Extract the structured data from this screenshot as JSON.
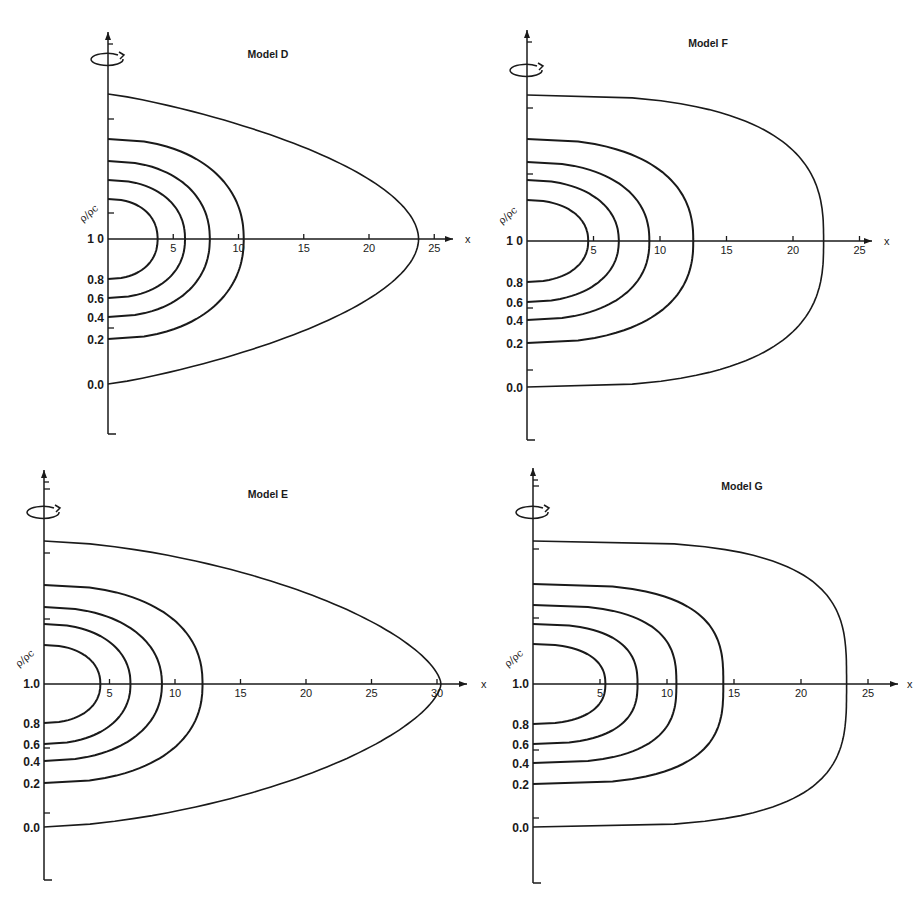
{
  "chart_data": [
    {
      "type": "line",
      "title": "Model D",
      "xlabel": "x",
      "ylabel": "ρ/ρc",
      "x_ticks": [
        5,
        10,
        15,
        20,
        25
      ],
      "contour_labels": [
        "1.0",
        "0.8",
        "0.6",
        "0.4",
        "0.2",
        "0.0"
      ],
      "contour_levels": [
        {
          "level": "0.8",
          "x_extent": 3.8
        },
        {
          "level": "0.6",
          "x_extent": 5.9
        },
        {
          "level": "0.4",
          "x_extent": 7.8
        },
        {
          "level": "0.2",
          "x_extent": 10.4
        },
        {
          "level": "0.0",
          "x_extent": 23.8
        }
      ],
      "xlim": [
        0,
        26
      ],
      "grid": false,
      "note": "Isodensity contours of rotating model; outer surface pointed (cusp) at x≈24"
    },
    {
      "type": "line",
      "title": "Model F",
      "xlabel": "x",
      "ylabel": "ρ/ρc",
      "x_ticks": [
        5,
        10,
        15,
        20,
        25
      ],
      "contour_labels": [
        "1.0",
        "0.8",
        "0.6",
        "0.4",
        "0.2",
        "0.0"
      ],
      "contour_levels": [
        {
          "level": "0.8",
          "x_extent": 4.6
        },
        {
          "level": "0.6",
          "x_extent": 6.9
        },
        {
          "level": "0.4",
          "x_extent": 9.2
        },
        {
          "level": "0.2",
          "x_extent": 12.5
        },
        {
          "level": "0.0",
          "x_extent": 22.3
        }
      ],
      "xlim": [
        0,
        26
      ],
      "grid": false
    },
    {
      "type": "line",
      "title": "Model E",
      "xlabel": "x",
      "ylabel": "ρ/ρc",
      "x_ticks": [
        5,
        10,
        15,
        20,
        25,
        30
      ],
      "contour_labels": [
        "1.0",
        "0.8",
        "0.6",
        "0.4",
        "0.2",
        "0.0"
      ],
      "contour_levels": [
        {
          "level": "0.8",
          "x_extent": 4.3
        },
        {
          "level": "0.6",
          "x_extent": 6.6
        },
        {
          "level": "0.4",
          "x_extent": 9.0
        },
        {
          "level": "0.2",
          "x_extent": 12.1
        },
        {
          "level": "0.0",
          "x_extent": 30.3
        }
      ],
      "xlim": [
        0,
        32
      ],
      "grid": false
    },
    {
      "type": "line",
      "title": "Model G",
      "xlabel": "x",
      "ylabel": "ρ/ρc",
      "x_ticks": [
        5,
        10,
        15,
        20,
        25
      ],
      "contour_labels": [
        "1.0",
        "0.8",
        "0.6",
        "0.4",
        "0.2",
        "0.0"
      ],
      "contour_levels": [
        {
          "level": "0.8",
          "x_extent": 5.4
        },
        {
          "level": "0.6",
          "x_extent": 7.8
        },
        {
          "level": "0.4",
          "x_extent": 10.7
        },
        {
          "level": "0.2",
          "x_extent": 14.2
        },
        {
          "level": "0.0",
          "x_extent": 23.4
        }
      ],
      "xlim": [
        0,
        26
      ],
      "grid": false
    }
  ],
  "panels": [
    {
      "title": "Model D",
      "layout": {
        "ox": 108,
        "oy": 239,
        "sx": 13.05,
        "axis_top": 32,
        "axis_bot": 434,
        "arrow_end": 453,
        "title_x": 268,
        "title_y": 58,
        "rot_y": 58,
        "x_lbl_x": 465,
        "offsets": [
          40,
          59,
          78,
          100,
          145
        ],
        "shapes": [
          2.2,
          2.2,
          2.2,
          2.2,
          1.25
        ],
        "outer_cusp": true,
        "extra_ticks": [
          -120,
          -26,
          89
        ]
      },
      "x_axis_label": "x",
      "y_axis_label": "ρ/ρc",
      "y_labels": [
        "1 0",
        "0.8",
        "0.6",
        "0.4",
        "0.2",
        "0.0"
      ],
      "x_tick_labels": [
        "5",
        "10",
        "15",
        "20",
        "25"
      ]
    },
    {
      "title": "Model F",
      "layout": {
        "ox": 527,
        "oy": 241,
        "sx": 13.3,
        "axis_top": 30,
        "axis_bot": 440,
        "arrow_end": 872,
        "title_x": 708,
        "title_y": 47,
        "rot_y": 69,
        "x_lbl_x": 884,
        "offsets": [
          41,
          61,
          79,
          102,
          146
        ],
        "shapes": [
          2.2,
          2.2,
          2.3,
          2.4,
          2.8
        ],
        "outer_cusp": false,
        "extra_ticks": [
          -133,
          -67,
          67,
          129
        ]
      },
      "x_axis_label": "x",
      "y_axis_label": "ρ/ρc",
      "y_labels": [
        "1 0",
        "0.8",
        "0.6",
        "0.4",
        "0.2",
        "0.0"
      ],
      "x_tick_labels": [
        "5",
        "10",
        "15",
        "20",
        "25"
      ]
    },
    {
      "title": "Model E",
      "layout": {
        "ox": 44,
        "oy": 684,
        "sx": 13.1,
        "axis_top": 470,
        "axis_bot": 880,
        "arrow_end": 467,
        "title_x": 268,
        "title_y": 498,
        "rot_y": 511,
        "x_lbl_x": 481,
        "offsets": [
          39,
          60,
          77,
          99,
          143
        ],
        "shapes": [
          2.2,
          2.2,
          2.2,
          2.3,
          1.6
        ],
        "outer_cusp": false,
        "extra_ticks": [
          -195,
          -131,
          -65,
          64,
          129
        ]
      },
      "x_axis_label": "x",
      "y_axis_label": "ρ/ρc",
      "y_labels": [
        "1.0",
        "0.8",
        "0.6",
        "0.4",
        "0.2",
        "0.0"
      ],
      "x_tick_labels": [
        "5",
        "10",
        "15",
        "20",
        "25",
        "30"
      ]
    },
    {
      "title": "Model G",
      "layout": {
        "ox": 533,
        "oy": 684,
        "sx": 13.4,
        "axis_top": 468,
        "axis_bot": 883,
        "arrow_end": 898,
        "title_x": 742,
        "title_y": 490,
        "rot_y": 511,
        "x_lbl_x": 907,
        "offsets": [
          40,
          60,
          79,
          100,
          143
        ],
        "shapes": [
          2.4,
          2.6,
          2.8,
          3.0,
          3.4
        ],
        "outer_cusp": false,
        "extra_ticks": [
          -198,
          -135,
          -66,
          66,
          134
        ]
      },
      "x_axis_label": "x",
      "y_axis_label": "ρ/ρc",
      "y_labels": [
        "1.0",
        "0.8",
        "0.6",
        "0.4",
        "0.2",
        "0.0"
      ],
      "x_tick_labels": [
        "5",
        "10",
        "15",
        "20",
        "25"
      ]
    }
  ]
}
